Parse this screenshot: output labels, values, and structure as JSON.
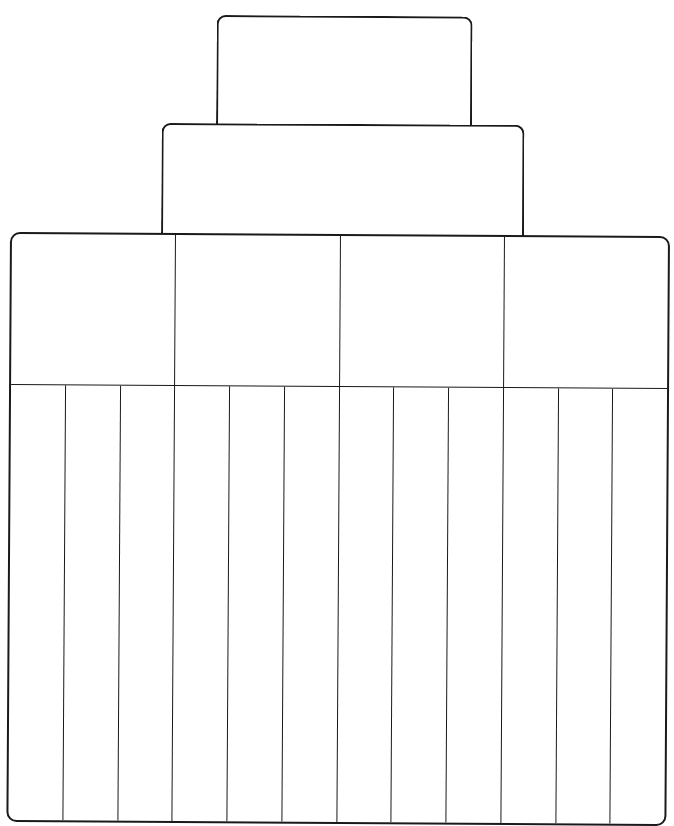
{
  "diagram": {
    "type": "hierarchy-organizer-template",
    "line_color": "#1a1a1a",
    "background": "#ffffff",
    "tier1": {
      "label": ""
    },
    "tier2": {
      "label": ""
    },
    "categories": [
      {
        "label": "",
        "subcategories": [
          "",
          "",
          ""
        ]
      },
      {
        "label": "",
        "subcategories": [
          "",
          "",
          ""
        ]
      },
      {
        "label": "",
        "subcategories": [
          "",
          "",
          ""
        ]
      },
      {
        "label": "",
        "subcategories": [
          "",
          "",
          ""
        ]
      }
    ]
  }
}
